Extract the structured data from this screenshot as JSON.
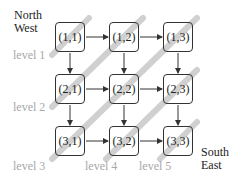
{
  "corners": {
    "north_west": [
      "North",
      "West"
    ],
    "south_east": [
      "South",
      "East"
    ]
  },
  "levels": [
    "level 1",
    "level 2",
    "level 3",
    "level 4",
    "level 5"
  ],
  "grid": {
    "rows": 3,
    "cols": 3,
    "nodes": [
      [
        "(1,1)",
        "(1,2)",
        "(1,3)"
      ],
      [
        "(2,1)",
        "(2,2)",
        "(2,3)"
      ],
      [
        "(3,1)",
        "(3,2)",
        "(3,3)"
      ]
    ]
  },
  "colors": {
    "stripe": "#c8c8c8",
    "node_border": "#333333",
    "level_text": "#a8a8a8",
    "arrow": "#333333"
  }
}
